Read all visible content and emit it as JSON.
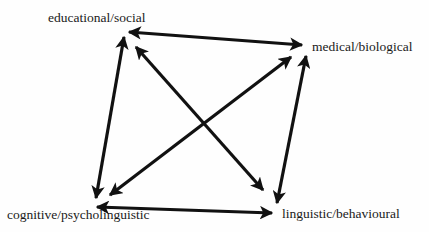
{
  "diagram": {
    "nodes": [
      {
        "id": "educational",
        "label": "educational/social"
      },
      {
        "id": "medical",
        "label": "medical/biological"
      },
      {
        "id": "cognitive",
        "label": "cognitive/psycholinguistic"
      },
      {
        "id": "linguistic",
        "label": "linguistic/behavioural"
      }
    ],
    "edges": [
      {
        "from": "educational",
        "to": "medical",
        "type": "bidirectional"
      },
      {
        "from": "educational",
        "to": "cognitive",
        "type": "bidirectional"
      },
      {
        "from": "medical",
        "to": "linguistic",
        "type": "bidirectional"
      },
      {
        "from": "cognitive",
        "to": "linguistic",
        "type": "bidirectional"
      },
      {
        "from": "educational",
        "to": "linguistic",
        "type": "bidirectional"
      },
      {
        "from": "medical",
        "to": "cognitive",
        "type": "bidirectional"
      }
    ],
    "colors": {
      "arrow": "#111111",
      "text": "#1a1a1a",
      "background": "#fefefe"
    }
  }
}
